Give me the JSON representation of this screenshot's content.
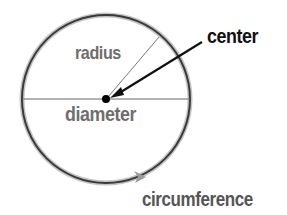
{
  "diagram": {
    "labels": {
      "radius": "radius",
      "center": "center",
      "diameter": "diameter",
      "circumference": "circumference"
    },
    "colors": {
      "circle_stroke": "#3a3a3a",
      "circle_halo": "#bdbdbd",
      "line": "#555555",
      "label_gray": "#6e6e6e",
      "label_black": "#111111",
      "center_dot": "#000000"
    }
  }
}
